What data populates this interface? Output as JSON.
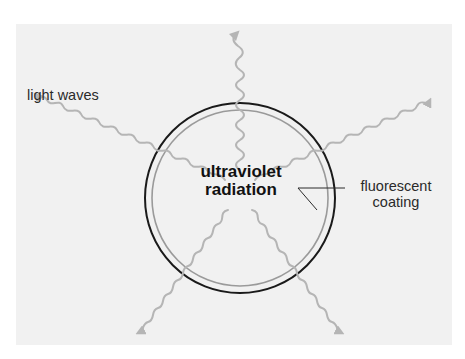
{
  "diagram": {
    "labels": {
      "light_waves": "light waves",
      "ultraviolet_line1": "ultraviolet",
      "ultraviolet_line2": "radiation",
      "fluorescent_line1": "fluorescent",
      "fluorescent_line2": "coating"
    },
    "colors": {
      "background": "#f1f1f1",
      "tube_outline": "#1a1a1a",
      "coating_ring": "#9a9a9a",
      "wave_color": "#b5b5b5",
      "text": "#2a2a2a"
    },
    "waves": [
      {
        "name": "wave-up",
        "direction": "up"
      },
      {
        "name": "wave-upper-left",
        "direction": "upper-left"
      },
      {
        "name": "wave-upper-right",
        "direction": "upper-right"
      },
      {
        "name": "wave-lower-left",
        "direction": "lower-left"
      },
      {
        "name": "wave-lower-right",
        "direction": "lower-right"
      }
    ]
  }
}
